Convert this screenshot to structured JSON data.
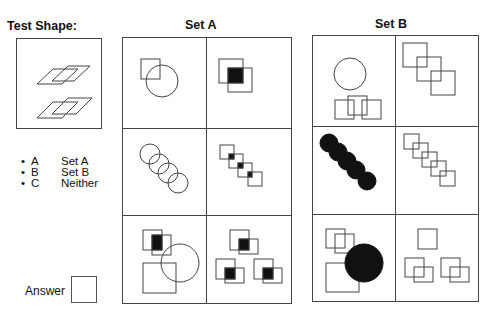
{
  "test_shape": {
    "title": "Test Shape:",
    "description": "two pairs of overlapping outlined parallelograms"
  },
  "sets": [
    {
      "title": "Set A",
      "cells": [
        "outlined square overlapping outlined circle",
        "two overlapping outlined squares, overlap filled black",
        "four overlapping outlined circles in diagonal chain",
        "four outlined squares in diagonal chain, overlaps filled black",
        "overlapping squares with filled overlap, large square, and circle",
        "three pairs of overlapping squares, each overlap filled black"
      ]
    },
    {
      "title": "Set B",
      "cells": [
        "outlined circle above three overlapping outlined squares",
        "three outlined squares in diagonal chain",
        "five filled black circles in diagonal chain",
        "five outlined squares in diagonal chain",
        "two overlapping squares, large square, and large filled black circle",
        "single square above two pairs of overlapping squares"
      ]
    }
  ],
  "options": [
    {
      "bullet": "•",
      "key": "A",
      "label": "Set A"
    },
    {
      "bullet": "•",
      "key": "B",
      "label": "Set B"
    },
    {
      "bullet": "•",
      "key": "C",
      "label": "Neither"
    }
  ],
  "answer": {
    "label": "Answer",
    "value": ""
  }
}
